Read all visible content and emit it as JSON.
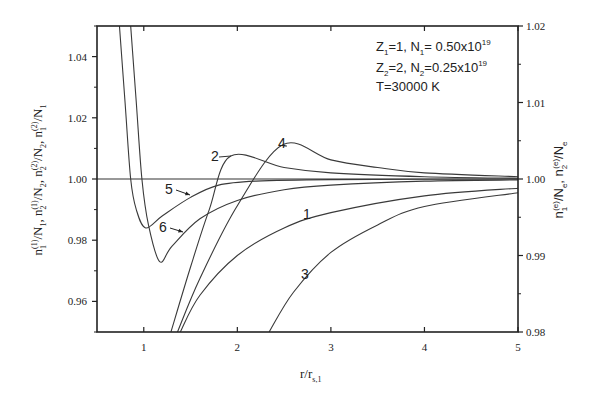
{
  "chart_data": {
    "type": "line",
    "title": "",
    "xlabel": "r/r_{s,1}",
    "xlabel_main": "r/r",
    "xlabel_sub": "s,1",
    "ylabel_left": "n1(1)/N1, n2(1)/N2, n2(2)/N2, n1(2)/N1",
    "ylabel_right": "n1(e)/Ne, n2(e)/Ne",
    "xlim": [
      0.5,
      5
    ],
    "ylim_left": [
      0.95,
      1.05
    ],
    "ylim_right": [
      0.98,
      1.02
    ],
    "x_ticks": [
      1,
      2,
      3,
      4,
      5
    ],
    "x_tick_labels": [
      "1",
      "2",
      "3",
      "4",
      "5"
    ],
    "y_ticks_left": [
      0.96,
      0.98,
      1.0,
      1.02,
      1.04
    ],
    "y_tick_labels_left": [
      "0.96",
      "0.98",
      "1.00",
      "1.02",
      "1.04"
    ],
    "y_ticks_right": [
      0.98,
      0.99,
      1.0,
      1.01,
      1.02
    ],
    "y_tick_labels_right": [
      "0.98",
      "0.99",
      "1.00",
      "1.01",
      "1.02"
    ],
    "reference_line": 1.0,
    "grid": false,
    "legend_position": "upper right",
    "annotations": [
      "Z1=1, N1= 0.50x10^19",
      "Z2=2, N2=0.25x10^19",
      "T=30000 K"
    ],
    "series": [
      {
        "name": "1",
        "axis": "left",
        "x": [
          1.39,
          1.6,
          2.0,
          2.5,
          3.0,
          4.0,
          5.0
        ],
        "values": [
          0.95,
          0.962,
          0.975,
          0.984,
          0.989,
          0.9945,
          0.997
        ]
      },
      {
        "name": "2",
        "axis": "right",
        "x": [
          1.29,
          1.5,
          1.7,
          1.93,
          2.5,
          3.0,
          4.0,
          5.0
        ],
        "values": [
          0.98,
          0.9885,
          0.996,
          1.003,
          1.0015,
          1.0008,
          1.0003,
          1.0001
        ]
      },
      {
        "name": "3",
        "axis": "left",
        "x": [
          2.34,
          2.6,
          3.0,
          3.5,
          4.0,
          5.0
        ],
        "values": [
          0.95,
          0.963,
          0.976,
          0.985,
          0.991,
          0.9955
        ]
      },
      {
        "name": "4",
        "axis": "right",
        "x": [
          1.36,
          1.6,
          2.0,
          2.49,
          3.0,
          3.5,
          4.0,
          5.0
        ],
        "values": [
          0.98,
          0.987,
          0.9965,
          1.0045,
          1.0025,
          1.0015,
          1.0008,
          1.0003
        ]
      },
      {
        "name": "5",
        "axis": "left",
        "x": [
          0.74,
          0.8,
          0.86,
          0.92,
          1.02,
          1.2,
          1.5,
          1.8,
          2.2,
          3.0,
          5.0
        ],
        "values": [
          1.05,
          1.025,
          1.0,
          0.99,
          0.984,
          0.988,
          0.994,
          0.998,
          0.9993,
          0.9998,
          1.0
        ]
      },
      {
        "name": "6",
        "axis": "left",
        "x": [
          0.86,
          0.92,
          0.98,
          1.05,
          1.17,
          1.3,
          1.6,
          2.0,
          2.5,
          3.0,
          4.0,
          5.0
        ],
        "values": [
          1.05,
          1.025,
          1.0,
          0.985,
          0.973,
          0.978,
          0.987,
          0.993,
          0.9965,
          0.998,
          0.9993,
          0.9997
        ]
      }
    ],
    "curve_labels": [
      {
        "text": "1",
        "x": 303,
        "y": 219
      },
      {
        "text": "2",
        "x": 211,
        "y": 161
      },
      {
        "text": "3",
        "x": 301,
        "y": 279
      },
      {
        "text": "4",
        "x": 278,
        "y": 148
      },
      {
        "text": "5",
        "x": 165,
        "y": 194
      },
      {
        "text": "6",
        "x": 159,
        "y": 232
      }
    ],
    "arrows": [
      {
        "from": [
          176,
          190
        ],
        "to": [
          190,
          195
        ]
      },
      {
        "from": [
          170,
          228
        ],
        "to": [
          183,
          232
        ]
      }
    ]
  },
  "legend": {
    "line1": {
      "z": "Z",
      "z_sub": "1",
      "z_val": "=1, N",
      "n_sub": "1",
      "n_val": "= 0.50x10",
      "exp": "19"
    },
    "line2": {
      "z": "Z",
      "z_sub": "2",
      "z_val": "=2, N",
      "n_sub": "2",
      "n_val": "=0.25x10",
      "exp": "19"
    },
    "line3": {
      "text": "T=30000 K"
    }
  },
  "axes": {
    "x_title_main": "r/r",
    "x_title_sub": "s,1",
    "left_title": {
      "parts": [
        "n",
        "1",
        "(1)",
        "/N",
        "1",
        ", n",
        "2",
        "(1)",
        "/N",
        "2",
        ", n",
        "2",
        "(2)",
        "/N",
        "2",
        ", n",
        "1",
        "(2)",
        "/N",
        "1"
      ]
    },
    "right_title": {
      "parts": [
        "n",
        "1",
        "(e)",
        "/N",
        "e",
        ", n",
        "2",
        "(e)",
        "/N",
        "e"
      ]
    }
  }
}
